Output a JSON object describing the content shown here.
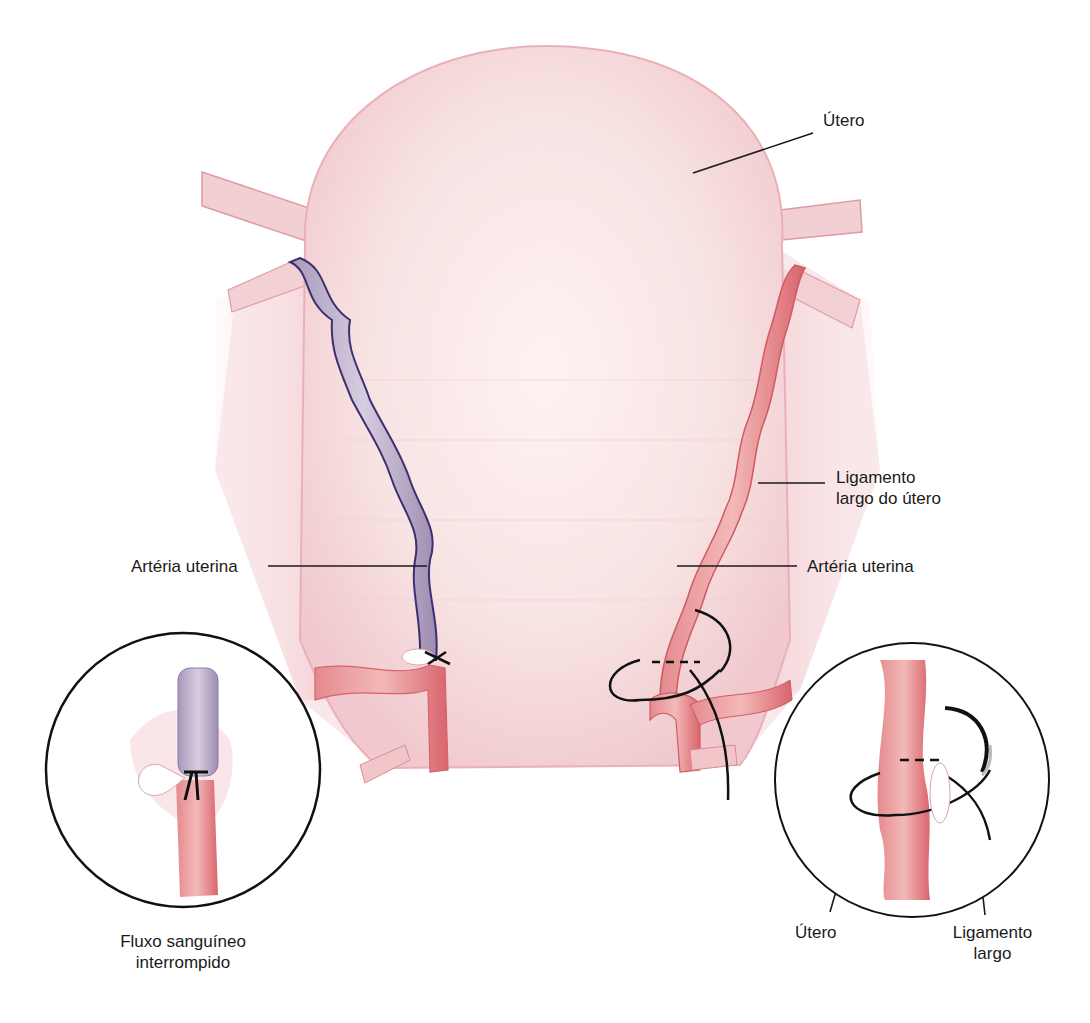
{
  "figure": {
    "labels": {
      "uterus": "Útero",
      "broad_ligament": [
        "Ligamento",
        "largo do útero"
      ],
      "uterine_artery_left": "Artéria uterina",
      "uterine_artery_right": "Artéria uterina",
      "inset_left": [
        "Fluxo sanguíneo",
        "interrompido"
      ],
      "inset_right_uterus": "Útero",
      "inset_right_ligament": [
        "Ligamento",
        "largo"
      ]
    },
    "colors": {
      "uterus_fill": "#f6dde0",
      "uterus_edge": "#e8a2ad",
      "artery": "#e07a7e",
      "artery_dark": "#c84a52",
      "ligated_vessel": "#b9aac4",
      "ligated_outline": "#4a3a78",
      "suture": "#111111",
      "caption": "#c83a6a"
    }
  }
}
